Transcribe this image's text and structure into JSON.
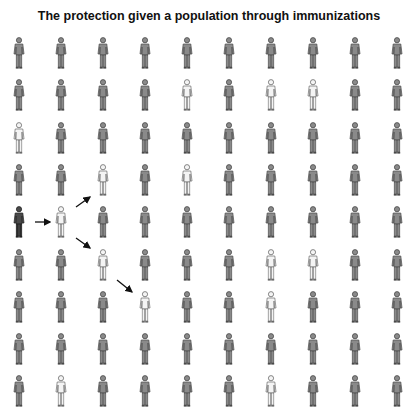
{
  "title": "The protection given a population through immunizations",
  "grid": {
    "columns": 10,
    "rows": 9,
    "col_x": [
      19,
      61,
      103,
      145,
      187,
      229,
      271,
      313,
      355,
      397
    ],
    "row_y": [
      37,
      79,
      122,
      164,
      206,
      249,
      291,
      333,
      375
    ]
  },
  "legend_states": {
    "immunized": {
      "fill": "#8a8a8a",
      "stroke": "#4a4a4a"
    },
    "susceptible": {
      "fill": "#f4f4f4",
      "stroke": "#6a6a6a"
    },
    "infected": {
      "fill": "#4a4a4a",
      "stroke": "#222222",
      "legs": "#2a2a2a"
    }
  },
  "people": {
    "infected": [
      [
        4,
        0
      ]
    ],
    "susceptible": [
      [
        1,
        4
      ],
      [
        1,
        6
      ],
      [
        1,
        7
      ],
      [
        2,
        0
      ],
      [
        3,
        2
      ],
      [
        3,
        4
      ],
      [
        4,
        1
      ],
      [
        5,
        2
      ],
      [
        5,
        6
      ],
      [
        5,
        7
      ],
      [
        6,
        3
      ],
      [
        6,
        6
      ],
      [
        8,
        1
      ],
      [
        8,
        6
      ]
    ]
  },
  "arrows": [
    {
      "from": [
        35,
        222
      ],
      "to": [
        50,
        222
      ]
    },
    {
      "from": [
        76,
        207
      ],
      "to": [
        90,
        197
      ]
    },
    {
      "from": [
        76,
        238
      ],
      "to": [
        90,
        248
      ]
    },
    {
      "from": [
        117,
        280
      ],
      "to": [
        132,
        292
      ]
    }
  ]
}
